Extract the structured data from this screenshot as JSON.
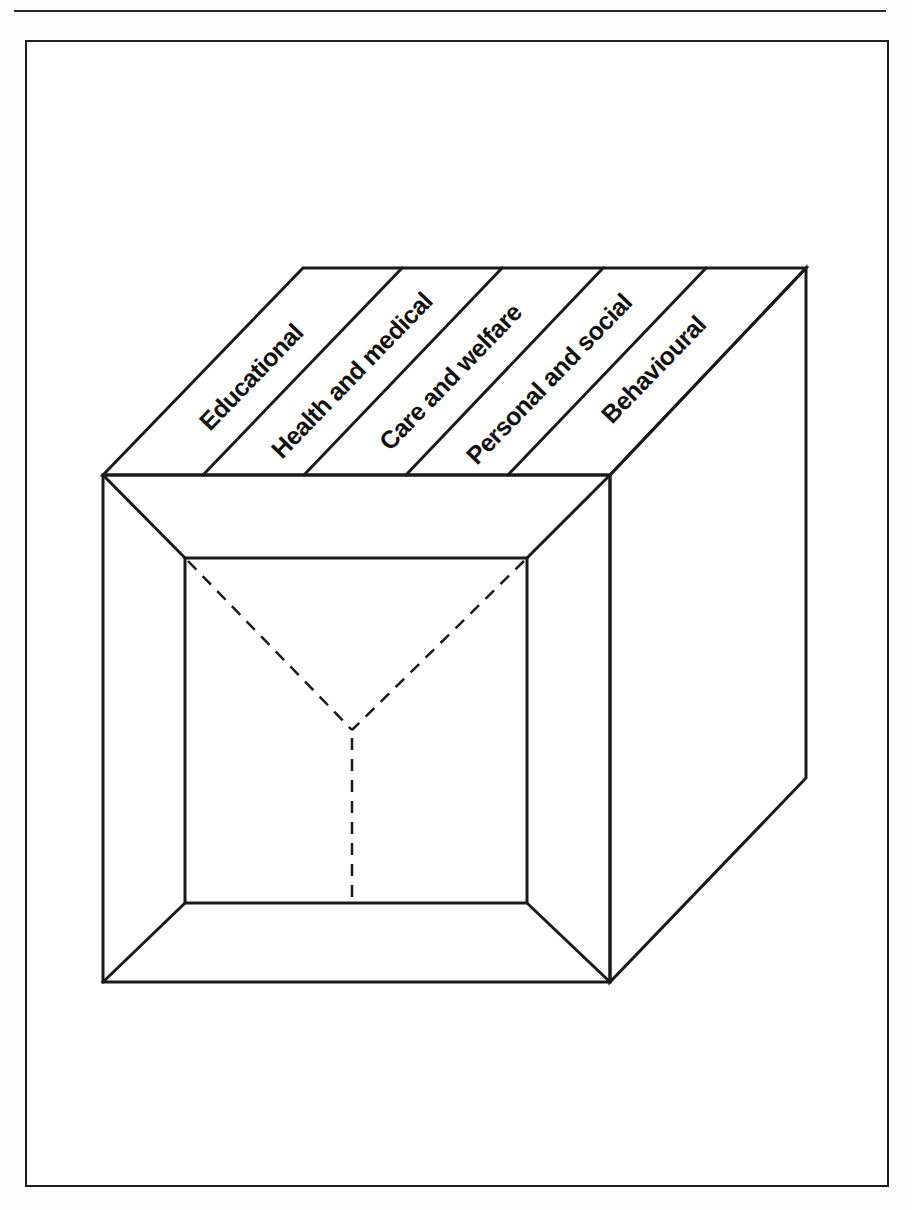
{
  "figure": {
    "type": "cube-dimensions-diagram",
    "top_face_labels": [
      "Educational",
      "Health and medical",
      "Care and welfare",
      "Personal and social",
      "Behavioural"
    ],
    "colors": {
      "line": "#1a1a1a",
      "background": "#ffffff",
      "label": "#111111"
    }
  }
}
